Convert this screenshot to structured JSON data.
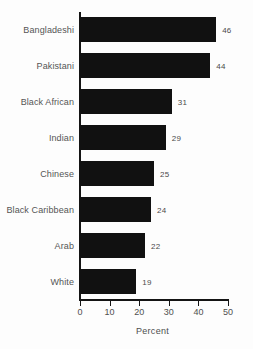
{
  "chart_data": {
    "type": "bar",
    "orientation": "horizontal",
    "title": "",
    "xlabel": "Percent",
    "ylabel": "",
    "xlim": [
      0,
      50
    ],
    "xticks": [
      0,
      10,
      20,
      30,
      40,
      50
    ],
    "grid": false,
    "legend": false,
    "bar_color": "#111111",
    "axis_color": "#141414",
    "categories": [
      "Bangladeshi",
      "Pakistani",
      "Black African",
      "Indian",
      "Chinese",
      "Black Caribbean",
      "Arab",
      "White"
    ],
    "values": [
      46,
      44,
      31,
      29,
      25,
      24,
      22,
      19
    ],
    "data_labels": [
      "46",
      "44",
      "31",
      "29",
      "25",
      "24",
      "22",
      "19"
    ]
  }
}
